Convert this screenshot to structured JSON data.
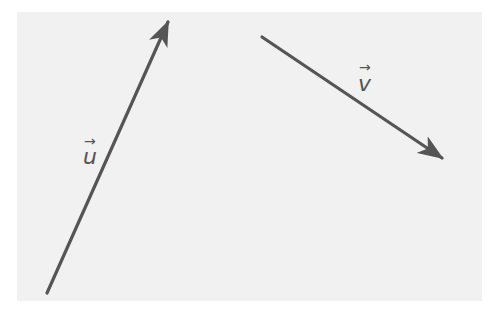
{
  "diagram": {
    "type": "vectors",
    "background_color": "#f1f1f1",
    "stroke_color": "#555555",
    "vectors": [
      {
        "name": "u",
        "label": "u",
        "label_arrow": "→",
        "start": [
          47,
          293
        ],
        "end": [
          170,
          18
        ]
      },
      {
        "name": "v",
        "label": "v",
        "label_arrow": "→",
        "start": [
          262,
          37
        ],
        "end": [
          444,
          159
        ]
      }
    ]
  }
}
